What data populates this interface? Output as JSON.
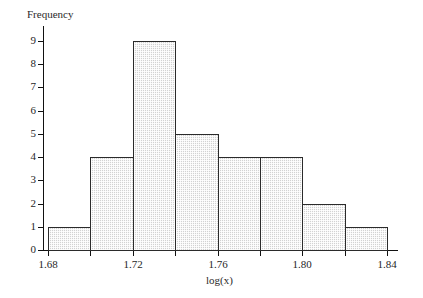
{
  "figure": {
    "y_axis_title": "Frequency",
    "x_axis_title": "log(x)"
  },
  "chart_data": {
    "type": "bar",
    "title": "",
    "subtitle": "",
    "xlabel": "log(x)",
    "ylabel": "Frequency",
    "orientation": "vertical",
    "grid": false,
    "legend": false,
    "legend_position": "none",
    "bin_width": 0.02,
    "bin_edges": [
      1.68,
      1.7,
      1.72,
      1.74,
      1.76,
      1.78,
      1.8,
      1.82,
      1.84
    ],
    "categories": [
      "1.68-1.70",
      "1.70-1.72",
      "1.72-1.74",
      "1.74-1.76",
      "1.76-1.78",
      "1.78-1.80",
      "1.80-1.82",
      "1.82-1.84"
    ],
    "values": [
      1,
      4,
      9,
      5,
      4,
      4,
      2,
      1
    ],
    "total_count": 30,
    "xlim": [
      1.675,
      1.8475
    ],
    "ylim": [
      0,
      9
    ],
    "xticks": [
      1.68,
      1.7,
      1.72,
      1.74,
      1.76,
      1.78,
      1.8,
      1.82,
      1.84
    ],
    "xtick_labels": [
      "1.68",
      "",
      "1.72",
      "",
      "1.76",
      "",
      "1.80",
      "",
      "1.84"
    ],
    "yticks": [
      0,
      1,
      2,
      3,
      4,
      5,
      6,
      7,
      8,
      9
    ],
    "ytick_labels": [
      "0",
      "1",
      "2",
      "3",
      "4",
      "5",
      "6",
      "7",
      "8",
      "9"
    ],
    "bar_fill_color": "#d2d2d2",
    "bar_edge_color": "#2b2b2b",
    "axis_color": "#111111",
    "background_color": "#ffffff"
  }
}
